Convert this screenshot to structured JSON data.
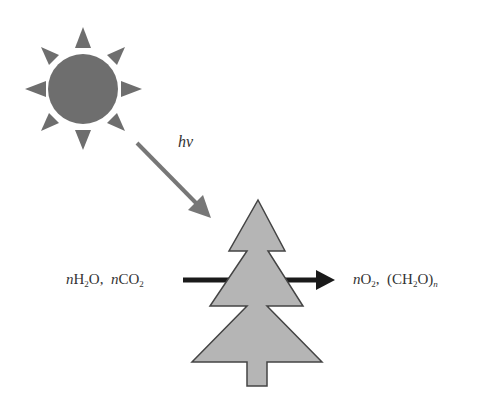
{
  "diagram": {
    "sun": {
      "icon": "sun-icon",
      "fill": "#6e6e6e"
    },
    "light_arrow": {
      "label": "hv",
      "color": "#777777"
    },
    "tree": {
      "icon": "tree-icon",
      "fill": "#b5b5b5",
      "stroke": "#444444"
    },
    "process_arrow": {
      "color": "#1a1a1a"
    },
    "reactants": {
      "n1": "n",
      "h": "H",
      "h_sub": "2",
      "o": "O,",
      "n2": "n",
      "co": "CO",
      "co_sub": "2"
    },
    "products": {
      "n1": "n",
      "o": "O",
      "o_sub": "2",
      "comma": ",",
      "paren_open": "(CH",
      "ch_sub": "2",
      "paren_close": "O)",
      "n_sub": "n"
    }
  }
}
